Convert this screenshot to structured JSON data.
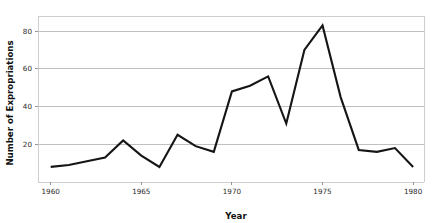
{
  "chart_data": {
    "type": "line",
    "title": "",
    "xlabel": "Year",
    "ylabel": "Number of Expropriations",
    "xlim": [
      1959.3,
      1980.6
    ],
    "ylim": [
      0,
      88
    ],
    "grid": "horizontal",
    "legend": "none",
    "x_ticks": [
      "1960",
      "1965",
      "1970",
      "1975",
      "1980"
    ],
    "x_tick_values": [
      1960,
      1965,
      1970,
      1975,
      1980
    ],
    "y_ticks": [
      "20",
      "40",
      "60",
      "80"
    ],
    "y_tick_values": [
      20,
      40,
      60,
      80
    ],
    "x": [
      1960,
      1961,
      1962,
      1963,
      1964,
      1965,
      1966,
      1967,
      1968,
      1969,
      1970,
      1971,
      1972,
      1973,
      1974,
      1975,
      1976,
      1977,
      1978,
      1979,
      1980
    ],
    "values": [
      8,
      9,
      11,
      13,
      22,
      14,
      8,
      25,
      19,
      16,
      48,
      51,
      56,
      31,
      70,
      83,
      45,
      17,
      16,
      18,
      8
    ],
    "series": [
      {
        "name": "Number of Expropriations",
        "color": "#151515",
        "values": [
          8,
          9,
          11,
          13,
          22,
          14,
          8,
          25,
          19,
          16,
          48,
          51,
          56,
          31,
          70,
          83,
          45,
          17,
          16,
          18,
          8
        ]
      }
    ],
    "annotations": []
  },
  "colors": {
    "line": "#151515",
    "grid": "#b9b9b9",
    "frame": "#c9c9c9",
    "text": "#2b2b2b",
    "background": "#ffffff"
  }
}
